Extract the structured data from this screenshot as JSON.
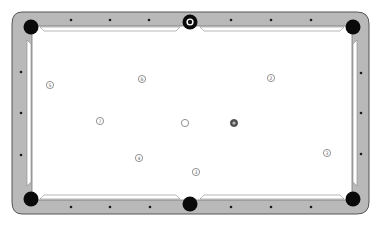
{
  "diagram": {
    "colors": {
      "background": "#ffffff",
      "rail": "#b9b9b9",
      "rail_edge": "#555555",
      "cloth": "#ffffff",
      "pocket": "#0a0a0a",
      "diamond": "#1a1a1a",
      "ball_outline": "#777777",
      "ball_number": "#666666"
    },
    "pockets": [
      {
        "id": "top-left",
        "x": 31,
        "y": 27
      },
      {
        "id": "top-middle",
        "x": 190,
        "y": 22
      },
      {
        "id": "top-right",
        "x": 353,
        "y": 27
      },
      {
        "id": "bottom-left",
        "x": 31,
        "y": 199
      },
      {
        "id": "bottom-middle",
        "x": 190,
        "y": 204
      },
      {
        "id": "bottom-right",
        "x": 353,
        "y": 199
      }
    ],
    "diamonds": {
      "top": [
        [
          71,
          20
        ],
        [
          110,
          20
        ],
        [
          149,
          20
        ],
        [
          231,
          20
        ],
        [
          271,
          20
        ],
        [
          311,
          20
        ]
      ],
      "bottom": [
        [
          71,
          207
        ],
        [
          110,
          207
        ],
        [
          150,
          207
        ],
        [
          231,
          207
        ],
        [
          271,
          207
        ],
        [
          311,
          207
        ]
      ],
      "left": [
        [
          21,
          72
        ],
        [
          21,
          113
        ],
        [
          21,
          155
        ]
      ],
      "right": [
        [
          361,
          73
        ],
        [
          361,
          113
        ],
        [
          361,
          154
        ]
      ]
    },
    "balls": [
      {
        "number": "1",
        "x": 190,
        "y": 22,
        "style": "in-pocket"
      },
      {
        "number": "5",
        "x": 50,
        "y": 85,
        "style": "outline"
      },
      {
        "number": "6",
        "x": 142,
        "y": 79,
        "style": "outline"
      },
      {
        "number": "2",
        "x": 271,
        "y": 78,
        "style": "outline"
      },
      {
        "number": "7",
        "x": 100,
        "y": 121,
        "style": "outline"
      },
      {
        "number": "",
        "x": 185,
        "y": 123,
        "style": "cue"
      },
      {
        "number": "8",
        "x": 234,
        "y": 123,
        "style": "dark"
      },
      {
        "number": "4",
        "x": 139,
        "y": 158,
        "style": "outline"
      },
      {
        "number": "3",
        "x": 196,
        "y": 172,
        "style": "outline"
      },
      {
        "number": "3",
        "x": 327,
        "y": 153,
        "style": "outline"
      }
    ]
  }
}
